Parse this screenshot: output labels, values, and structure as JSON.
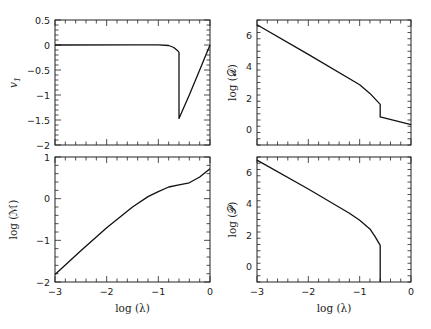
{
  "chart_data": [
    {
      "id": "panel-v1",
      "type": "line",
      "xlabel": "",
      "ylabel": "v₁",
      "xlim": [
        -3,
        0
      ],
      "ylim": [
        -2,
        0.5
      ],
      "xticks": [
        -3,
        -2,
        -1,
        0
      ],
      "xtick_labels_visible": false,
      "yticks": [
        0.5,
        0,
        -0.5,
        -1,
        -1.5,
        -2
      ],
      "ytick_labels": [
        "0.5",
        "0",
        "−0.5",
        "−1",
        "−1.5",
        "−2"
      ],
      "series": [
        {
          "name": "v1",
          "x": [
            -3,
            -1.5,
            -1.0,
            -0.8,
            -0.7,
            -0.62,
            -0.6,
            -0.6,
            -0.4,
            -0.2,
            0
          ],
          "y": [
            0,
            0.005,
            0.003,
            -0.01,
            -0.05,
            -0.12,
            -0.15,
            -1.47,
            -1.0,
            -0.5,
            0.0
          ]
        }
      ]
    },
    {
      "id": "panel-logD",
      "type": "line",
      "xlabel": "",
      "ylabel": "log (𝒟)",
      "xlim": [
        -3,
        0
      ],
      "ylim": [
        -1,
        7
      ],
      "xticks": [
        -3,
        -2,
        -1,
        0
      ],
      "xtick_labels_visible": false,
      "yticks": [
        0,
        2,
        4,
        6
      ],
      "ytick_labels": [
        "0",
        "2",
        "4",
        "6"
      ],
      "series": [
        {
          "name": "logD",
          "x": [
            -3,
            -2,
            -1,
            -0.8,
            -0.7,
            -0.6,
            -0.6,
            0
          ],
          "y": [
            6.7,
            4.8,
            2.85,
            2.3,
            1.95,
            1.6,
            0.8,
            0.3
          ]
        }
      ]
    },
    {
      "id": "panel-logM",
      "type": "line",
      "xlabel": "log (λ)",
      "ylabel": "log (ℳ)",
      "xlim": [
        -3,
        0
      ],
      "ylim": [
        -2,
        1
      ],
      "xticks": [
        -3,
        -2,
        -1,
        0
      ],
      "xtick_labels": [
        "−3",
        "−2",
        "−1",
        "0"
      ],
      "yticks": [
        1,
        0,
        -1,
        -2
      ],
      "ytick_labels": [
        "1",
        "0",
        "−1",
        "−2"
      ],
      "series": [
        {
          "name": "logM",
          "x": [
            -3,
            -2.5,
            -2,
            -1.5,
            -1.2,
            -1.0,
            -0.8,
            -0.6,
            -0.4,
            -0.2,
            0
          ],
          "y": [
            -1.82,
            -1.25,
            -0.7,
            -0.2,
            0.05,
            0.17,
            0.28,
            0.33,
            0.38,
            0.52,
            0.72
          ]
        }
      ]
    },
    {
      "id": "panel-logP",
      "type": "line",
      "xlabel": "log (λ)",
      "ylabel": "log (𝒫)",
      "xlim": [
        -3,
        0
      ],
      "ylim": [
        -1,
        7
      ],
      "xticks": [
        -3,
        -2,
        -1,
        0
      ],
      "xtick_labels": [
        "−3",
        "−2",
        "−1",
        "0"
      ],
      "yticks": [
        0,
        2,
        4,
        6
      ],
      "ytick_labels": [
        "0",
        "2",
        "4",
        "6"
      ],
      "series": [
        {
          "name": "logP",
          "x": [
            -3,
            -2,
            -1.2,
            -1.0,
            -0.8,
            -0.7,
            -0.6,
            -0.6
          ],
          "y": [
            6.8,
            4.95,
            3.4,
            2.95,
            2.4,
            1.9,
            1.35,
            -1.0
          ]
        }
      ]
    }
  ],
  "labels": {
    "v1": "v",
    "v1_sub": "1",
    "logD": "log (𝒟)",
    "logM": "log (ℳ)",
    "logP": "log (𝒫)",
    "xlabel": "log (λ)"
  }
}
